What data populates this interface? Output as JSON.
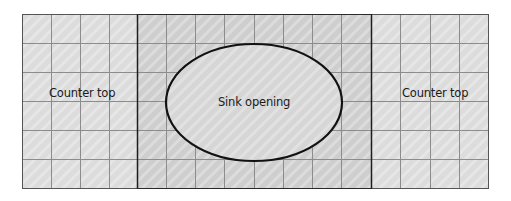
{
  "diagram": {
    "title": "",
    "sections": [
      {
        "id": "left-counter",
        "label": "Counter top",
        "columns": 4,
        "rows": 6
      },
      {
        "id": "sink-area",
        "label": "Sink opening",
        "columns": 8,
        "rows": 6
      },
      {
        "id": "right-counter",
        "label": "Counter top",
        "columns": 4,
        "rows": 6
      }
    ],
    "labels": {
      "left_counter": "Counter top",
      "sink": "Sink opening",
      "right_counter": "Counter top"
    },
    "colors": {
      "counter_fill": "#dedede",
      "sink_area_fill": "#cdcdcd",
      "grid_line": "#8a8a8a",
      "outline": "#222222",
      "ellipse_stroke": "#111111",
      "text": "#1a1a1a"
    }
  }
}
